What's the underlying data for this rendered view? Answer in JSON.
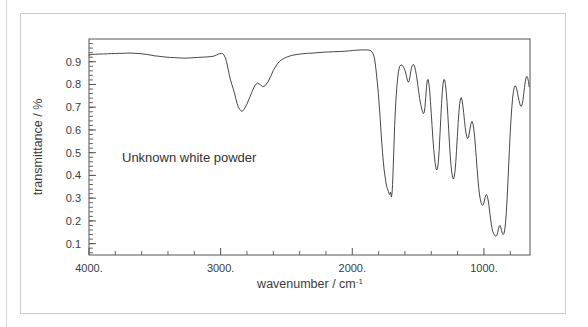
{
  "figure": {
    "annotation": "Unknown white powder",
    "frame_color": "#cdcdcd",
    "background": "#ffffff",
    "trace_color": "#333333",
    "axis_color": "#555555"
  },
  "axes": {
    "y_title": "transmittance / %",
    "x_title_main": "wavenumber / cm",
    "x_title_exponent": "-1",
    "y_ticks": [
      "0.9",
      "0.8",
      "0.7",
      "0.6",
      "0.5",
      "0.4",
      "0.3",
      "0.2",
      "0.1"
    ],
    "y_tick_values": [
      0.9,
      0.8,
      0.7,
      0.6,
      0.5,
      0.4,
      0.3,
      0.2,
      0.1
    ],
    "x_ticks": [
      "4000.",
      "3000.",
      "2000.",
      "1000."
    ],
    "x_tick_values": [
      4000,
      3000,
      2000,
      1000
    ],
    "x_minor_step": 200,
    "y_minor_step": 0.02
  },
  "chart_data": {
    "type": "line",
    "title": "",
    "subtitle": "",
    "xlabel": "wavenumber / cm-1",
    "ylabel": "transmittance / %",
    "xlim": [
      4000,
      650
    ],
    "ylim": [
      0.05,
      1.0
    ],
    "x_inverted": true,
    "grid": false,
    "legend": "none",
    "annotations": [
      {
        "text": "Unknown white powder",
        "x": 3520,
        "y": 0.45
      }
    ],
    "series": [
      {
        "name": "IR transmittance spectrum",
        "color": "#333333",
        "x": [
          4000,
          3975,
          3950,
          3920,
          3890,
          3860,
          3830,
          3800,
          3770,
          3740,
          3710,
          3680,
          3650,
          3620,
          3590,
          3560,
          3530,
          3500,
          3470,
          3440,
          3410,
          3380,
          3350,
          3320,
          3290,
          3260,
          3230,
          3200,
          3170,
          3140,
          3110,
          3080,
          3050,
          3030,
          3010,
          2995,
          2985,
          2975,
          2965,
          2955,
          2945,
          2935,
          2925,
          2915,
          2905,
          2895,
          2885,
          2875,
          2865,
          2855,
          2845,
          2835,
          2820,
          2800,
          2780,
          2760,
          2740,
          2720,
          2700,
          2680,
          2660,
          2640,
          2620,
          2600,
          2570,
          2540,
          2500,
          2460,
          2420,
          2380,
          2340,
          2300,
          2260,
          2220,
          2180,
          2140,
          2100,
          2060,
          2020,
          1990,
          1960,
          1930,
          1900,
          1880,
          1865,
          1850,
          1840,
          1832,
          1825,
          1818,
          1810,
          1802,
          1795,
          1788,
          1782,
          1776,
          1770,
          1764,
          1758,
          1752,
          1746,
          1742,
          1738,
          1734,
          1730,
          1726,
          1722,
          1718,
          1714,
          1710,
          1706,
          1702,
          1698,
          1694,
          1690,
          1684,
          1678,
          1670,
          1660,
          1650,
          1640,
          1630,
          1620,
          1610,
          1600,
          1592,
          1586,
          1580,
          1574,
          1568,
          1562,
          1556,
          1550,
          1544,
          1538,
          1532,
          1526,
          1520,
          1512,
          1504,
          1496,
          1488,
          1480,
          1472,
          1466,
          1460,
          1454,
          1448,
          1442,
          1436,
          1430,
          1424,
          1418,
          1412,
          1406,
          1400,
          1394,
          1388,
          1382,
          1376,
          1370,
          1364,
          1358,
          1352,
          1346,
          1340,
          1334,
          1328,
          1322,
          1316,
          1310,
          1304,
          1298,
          1292,
          1286,
          1280,
          1274,
          1268,
          1262,
          1256,
          1250,
          1244,
          1238,
          1232,
          1226,
          1220,
          1214,
          1208,
          1202,
          1196,
          1190,
          1184,
          1178,
          1172,
          1166,
          1160,
          1154,
          1148,
          1142,
          1136,
          1130,
          1124,
          1118,
          1112,
          1106,
          1100,
          1094,
          1088,
          1082,
          1076,
          1070,
          1064,
          1058,
          1052,
          1046,
          1040,
          1034,
          1028,
          1022,
          1016,
          1010,
          1004,
          998,
          992,
          986,
          980,
          974,
          968,
          962,
          956,
          950,
          944,
          938,
          932,
          926,
          920,
          914,
          908,
          902,
          896,
          890,
          884,
          878,
          872,
          866,
          860,
          854,
          848,
          842,
          836,
          830,
          824,
          818,
          812,
          806,
          800,
          794,
          788,
          782,
          776,
          770,
          764,
          758,
          752,
          746,
          740,
          734,
          728,
          722,
          716,
          710,
          704,
          698,
          692,
          686,
          680,
          674,
          668,
          662,
          656
        ],
        "y": [
          0.93,
          0.932,
          0.933,
          0.934,
          0.934,
          0.935,
          0.936,
          0.936,
          0.937,
          0.937,
          0.938,
          0.938,
          0.937,
          0.936,
          0.934,
          0.932,
          0.929,
          0.926,
          0.924,
          0.922,
          0.92,
          0.919,
          0.918,
          0.917,
          0.916,
          0.916,
          0.917,
          0.918,
          0.919,
          0.92,
          0.921,
          0.922,
          0.925,
          0.93,
          0.935,
          0.937,
          0.936,
          0.93,
          0.918,
          0.9,
          0.872,
          0.845,
          0.82,
          0.8,
          0.782,
          0.762,
          0.74,
          0.716,
          0.7,
          0.69,
          0.684,
          0.682,
          0.692,
          0.714,
          0.742,
          0.77,
          0.796,
          0.806,
          0.8,
          0.79,
          0.796,
          0.812,
          0.835,
          0.862,
          0.89,
          0.908,
          0.92,
          0.928,
          0.932,
          0.935,
          0.937,
          0.938,
          0.94,
          0.942,
          0.943,
          0.944,
          0.945,
          0.946,
          0.948,
          0.95,
          0.951,
          0.952,
          0.952,
          0.952,
          0.95,
          0.944,
          0.932,
          0.916,
          0.89,
          0.855,
          0.81,
          0.76,
          0.705,
          0.65,
          0.595,
          0.545,
          0.5,
          0.46,
          0.425,
          0.398,
          0.376,
          0.362,
          0.35,
          0.342,
          0.336,
          0.33,
          0.322,
          0.316,
          0.318,
          0.326,
          0.318,
          0.305,
          0.322,
          0.36,
          0.42,
          0.52,
          0.62,
          0.72,
          0.8,
          0.855,
          0.88,
          0.886,
          0.884,
          0.876,
          0.862,
          0.846,
          0.83,
          0.816,
          0.81,
          0.816,
          0.834,
          0.856,
          0.874,
          0.884,
          0.888,
          0.886,
          0.878,
          0.862,
          0.838,
          0.806,
          0.77,
          0.738,
          0.712,
          0.692,
          0.68,
          0.672,
          0.676,
          0.7,
          0.744,
          0.79,
          0.82,
          0.822,
          0.804,
          0.77,
          0.724,
          0.672,
          0.618,
          0.566,
          0.52,
          0.482,
          0.452,
          0.432,
          0.424,
          0.432,
          0.46,
          0.51,
          0.578,
          0.65,
          0.716,
          0.77,
          0.806,
          0.822,
          0.82,
          0.8,
          0.766,
          0.72,
          0.664,
          0.602,
          0.542,
          0.488,
          0.444,
          0.412,
          0.392,
          0.384,
          0.392,
          0.416,
          0.456,
          0.51,
          0.57,
          0.628,
          0.678,
          0.716,
          0.738,
          0.742,
          0.73,
          0.706,
          0.676,
          0.642,
          0.61,
          0.586,
          0.57,
          0.562,
          0.566,
          0.582,
          0.604,
          0.624,
          0.636,
          0.636,
          0.624,
          0.6,
          0.566,
          0.524,
          0.478,
          0.43,
          0.386,
          0.348,
          0.318,
          0.296,
          0.282,
          0.272,
          0.268,
          0.272,
          0.284,
          0.3,
          0.312,
          0.316,
          0.308,
          0.292,
          0.268,
          0.24,
          0.212,
          0.186,
          0.166,
          0.152,
          0.144,
          0.138,
          0.134,
          0.132,
          0.136,
          0.148,
          0.164,
          0.176,
          0.18,
          0.172,
          0.158,
          0.146,
          0.14,
          0.144,
          0.16,
          0.19,
          0.236,
          0.296,
          0.366,
          0.442,
          0.518,
          0.588,
          0.65,
          0.7,
          0.74,
          0.768,
          0.786,
          0.794,
          0.792,
          0.782,
          0.766,
          0.748,
          0.73,
          0.716,
          0.706,
          0.704,
          0.712,
          0.73,
          0.756,
          0.786,
          0.812,
          0.83,
          0.836,
          0.83,
          0.814,
          0.79
        ]
      }
    ]
  }
}
